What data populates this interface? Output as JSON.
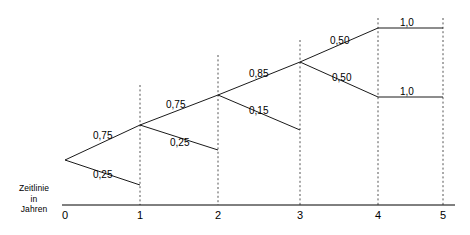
{
  "diagram": {
    "axis": {
      "caption_lines": [
        "Zeitlinie",
        "in",
        "Jahren"
      ],
      "tick_labels": [
        "0",
        "1",
        "2",
        "3",
        "4",
        "5"
      ]
    },
    "edge_labels": [
      {
        "text": "0,75"
      },
      {
        "text": "0,25"
      },
      {
        "text": "0,75"
      },
      {
        "text": "0,25"
      },
      {
        "text": "0,85"
      },
      {
        "text": "0,15"
      },
      {
        "text": "0,50"
      },
      {
        "text": "0,50"
      },
      {
        "text": "1,0"
      },
      {
        "text": "1,0"
      }
    ],
    "colors": {
      "line": "#000000",
      "dashed_gridline": "#555555",
      "background": "#ffffff",
      "text": "#000000"
    }
  },
  "chart_data": {
    "type": "diagram",
    "xlabel": "Zeitlinie in Jahren",
    "xticks": [
      0,
      1,
      2,
      3,
      4,
      5
    ],
    "nodes": [
      {
        "id": "n0",
        "t": 0,
        "x": 65,
        "y": 160
      },
      {
        "id": "n1u",
        "t": 1,
        "x": 140,
        "y": 125
      },
      {
        "id": "n1d",
        "t": 1,
        "x": 140,
        "y": 185
      },
      {
        "id": "n2u",
        "t": 2,
        "x": 218,
        "y": 95
      },
      {
        "id": "n2d",
        "t": 2,
        "x": 218,
        "y": 150
      },
      {
        "id": "n3u",
        "t": 3,
        "x": 300,
        "y": 62
      },
      {
        "id": "n3d",
        "t": 3,
        "x": 300,
        "y": 130
      },
      {
        "id": "n4u",
        "t": 4,
        "x": 378,
        "y": 28
      },
      {
        "id": "n4d",
        "t": 4,
        "x": 378,
        "y": 97
      },
      {
        "id": "n5u",
        "t": 5,
        "x": 443,
        "y": 28
      },
      {
        "id": "n5d",
        "t": 5,
        "x": 443,
        "y": 97
      }
    ],
    "edges": [
      {
        "from": "n0",
        "to": "n1u",
        "probability": "0,75",
        "value": 0.75,
        "label_x": 93,
        "label_y": 130
      },
      {
        "from": "n0",
        "to": "n1d",
        "probability": "0,25",
        "value": 0.25,
        "label_x": 93,
        "label_y": 169
      },
      {
        "from": "n1u",
        "to": "n2u",
        "probability": "0,75",
        "value": 0.75,
        "label_x": 166,
        "label_y": 99
      },
      {
        "from": "n1u",
        "to": "n2d",
        "probability": "0,25",
        "value": 0.25,
        "label_x": 170,
        "label_y": 137
      },
      {
        "from": "n2u",
        "to": "n3u",
        "probability": "0,85",
        "value": 0.85,
        "label_x": 249,
        "label_y": 68
      },
      {
        "from": "n2u",
        "to": "n3d",
        "probability": "0,15",
        "value": 0.15,
        "label_x": 249,
        "label_y": 105
      },
      {
        "from": "n3u",
        "to": "n4u",
        "probability": "0,50",
        "value": 0.5,
        "label_x": 330,
        "label_y": 35
      },
      {
        "from": "n3u",
        "to": "n4d",
        "probability": "0,50",
        "value": 0.5,
        "label_x": 332,
        "label_y": 72
      },
      {
        "from": "n4u",
        "to": "n5u",
        "probability": "1,0",
        "value": 1.0,
        "label_x": 400,
        "label_y": 17
      },
      {
        "from": "n4d",
        "to": "n5d",
        "probability": "1,0",
        "value": 1.0,
        "label_x": 400,
        "label_y": 86
      }
    ],
    "gridlines": [
      {
        "t": 1,
        "x": 140,
        "y_top": 85,
        "y_bottom": 205
      },
      {
        "t": 2,
        "x": 218,
        "y_top": 55,
        "y_bottom": 205
      },
      {
        "t": 3,
        "x": 300,
        "y_top": 40,
        "y_bottom": 205
      },
      {
        "t": 4,
        "x": 378,
        "y_top": 18,
        "y_bottom": 205
      },
      {
        "t": 5,
        "x": 443,
        "y_top": 18,
        "y_bottom": 205
      }
    ],
    "axis_line": {
      "x1": 62,
      "x2": 455,
      "y": 205
    },
    "grid": true,
    "legend": "none"
  }
}
